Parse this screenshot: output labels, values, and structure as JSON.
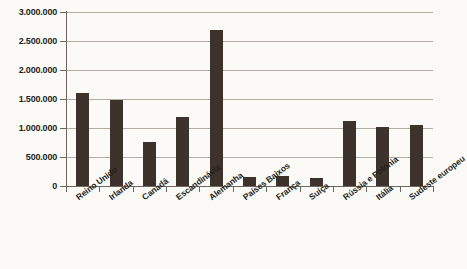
{
  "chart_data": {
    "type": "bar",
    "title": "",
    "subtitle": "",
    "xlabel": "",
    "ylabel": "",
    "ylim": [
      0,
      3000000
    ],
    "grid": true,
    "legend": false,
    "legend_position": "none",
    "y_ticks": [
      "0",
      "500.000",
      "1.000.000",
      "1.500.000",
      "2.000.000",
      "2.500.000",
      "3.000.000"
    ],
    "y_tick_values": [
      0,
      500000,
      1000000,
      1500000,
      2000000,
      2500000,
      3000000
    ],
    "categories": [
      "Reino Unido",
      "Irlanda",
      "Canadá",
      "Escandinávia",
      "Alemanha",
      "Países Baixos",
      "França",
      "Suíça",
      "Rússia e Polónia",
      "Itália",
      "Sudeste europeu"
    ],
    "values": [
      1600000,
      1490000,
      760000,
      1190000,
      2690000,
      150000,
      170000,
      140000,
      1120000,
      1020000,
      1060000
    ],
    "bar_color": "#3d332c",
    "grid_color": "#b3aca3",
    "axis_color": "#6f675e",
    "background_color": "#fbfaf7"
  }
}
